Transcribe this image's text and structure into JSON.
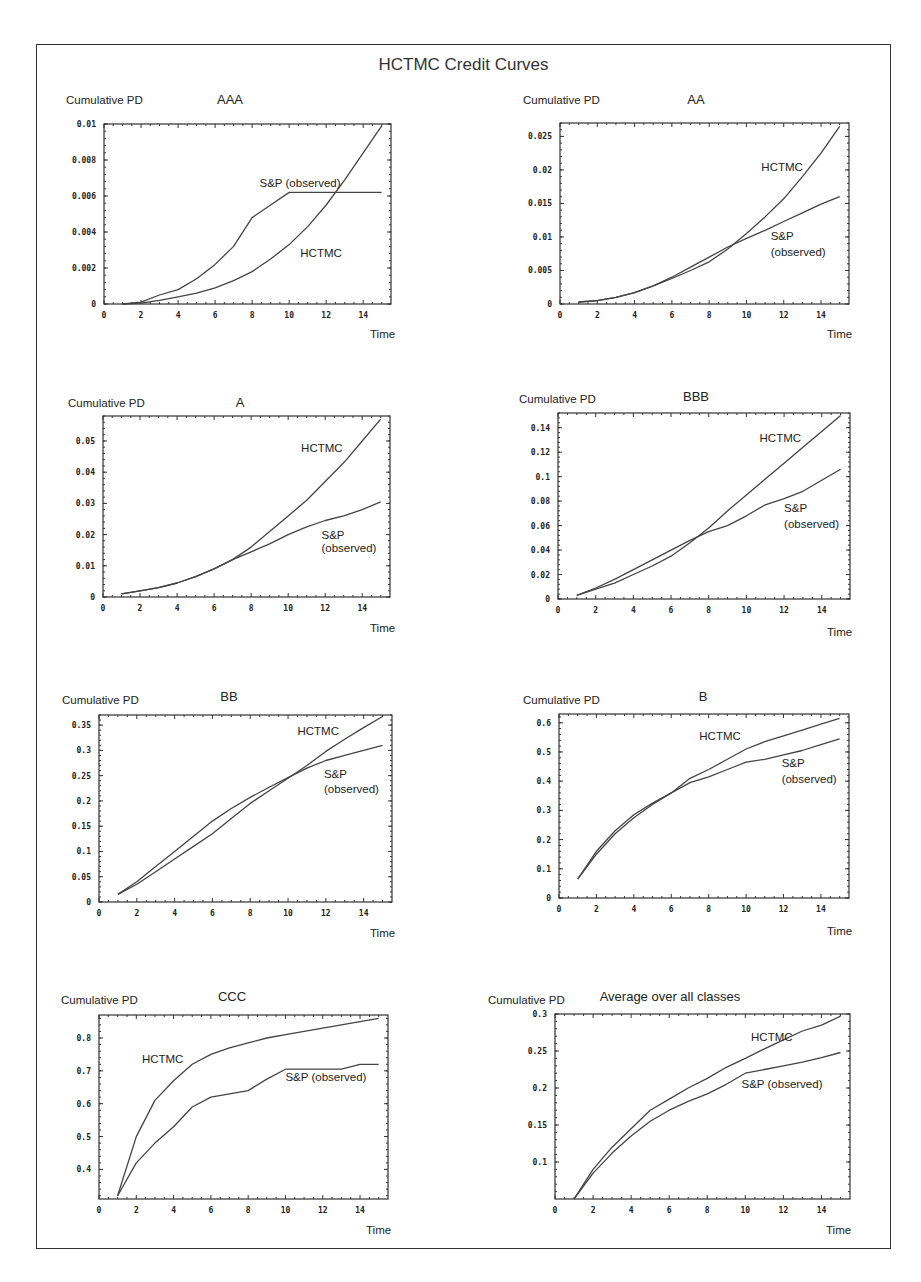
{
  "figure": {
    "title": "HCTMC Credit Curves"
  },
  "chart_data": [
    {
      "type": "line",
      "title": "AAA",
      "xlabel": "Time",
      "ylabel": "Cumulative PD",
      "xlim": [
        0,
        15.5
      ],
      "ylim": [
        0,
        0.01
      ],
      "xticks": [
        "0",
        "2",
        "4",
        "6",
        "8",
        "10",
        "12",
        "14"
      ],
      "yticks": [
        {
          "v": 0,
          "l": "0"
        },
        {
          "v": 0.002,
          "l": "0.002"
        },
        {
          "v": 0.004,
          "l": "0.004"
        },
        {
          "v": 0.006,
          "l": "0.006"
        },
        {
          "v": 0.008,
          "l": "0.008"
        },
        {
          "v": 0.01,
          "l": "0.01"
        }
      ],
      "grid": false,
      "x": [
        1,
        2,
        3,
        4,
        5,
        6,
        7,
        8,
        9,
        10,
        11,
        12,
        13,
        14,
        15
      ],
      "series": [
        {
          "name": "S&P (observed)",
          "values": [
            0,
            0.0001,
            0.0005,
            0.0008,
            0.0014,
            0.0022,
            0.0032,
            0.0048,
            0.0055,
            0.0062,
            0.0062,
            0.0062,
            0.0062,
            0.0062,
            0.0062
          ]
        },
        {
          "name": "HCTMC",
          "values": [
            0,
            5e-05,
            0.0002,
            0.0004,
            0.0006,
            0.0009,
            0.0013,
            0.0018,
            0.0025,
            0.0033,
            0.0043,
            0.0055,
            0.0069,
            0.0084,
            0.0099
          ]
        }
      ],
      "annotations": [
        {
          "text": "S&P (observed)",
          "x": 8.4,
          "y": 0.0065
        },
        {
          "text": "HCTMC",
          "x": 10.6,
          "y": 0.0026
        }
      ]
    },
    {
      "type": "line",
      "title": "AA",
      "xlabel": "Time",
      "ylabel": "Cumulative PD",
      "xlim": [
        0,
        15.5
      ],
      "ylim": [
        0,
        0.027
      ],
      "xticks": [
        "0",
        "2",
        "4",
        "6",
        "8",
        "10",
        "12",
        "14"
      ],
      "yticks": [
        {
          "v": 0,
          "l": "0"
        },
        {
          "v": 0.005,
          "l": "0.005"
        },
        {
          "v": 0.01,
          "l": "0.01"
        },
        {
          "v": 0.015,
          "l": "0.015"
        },
        {
          "v": 0.02,
          "l": "0.02"
        },
        {
          "v": 0.025,
          "l": "0.025"
        }
      ],
      "grid": false,
      "x": [
        1,
        2,
        3,
        4,
        5,
        6,
        7,
        8,
        9,
        10,
        11,
        12,
        13,
        14,
        15
      ],
      "series": [
        {
          "name": "HCTMC",
          "values": [
            0.0003,
            0.0005,
            0.001,
            0.0017,
            0.0027,
            0.0038,
            0.005,
            0.0063,
            0.0082,
            0.0105,
            0.013,
            0.0157,
            0.019,
            0.0225,
            0.0265
          ]
        },
        {
          "name": "S&P (observed)",
          "values": [
            0.0003,
            0.0005,
            0.001,
            0.0017,
            0.0027,
            0.004,
            0.0055,
            0.007,
            0.0085,
            0.0098,
            0.011,
            0.0123,
            0.0136,
            0.0149,
            0.016
          ]
        }
      ],
      "annotations": [
        {
          "text": "HCTMC",
          "x": 10.8,
          "y": 0.0198
        },
        {
          "text": "S&P",
          "x": 11.3,
          "y": 0.0096
        },
        {
          "text": "(observed)",
          "x": 11.3,
          "y": 0.0072
        }
      ]
    },
    {
      "type": "line",
      "title": "A",
      "xlabel": "Time",
      "ylabel": "Cumulative PD",
      "xlim": [
        0,
        15.5
      ],
      "ylim": [
        0,
        0.058
      ],
      "xticks": [
        "0",
        "2",
        "4",
        "6",
        "8",
        "10",
        "12",
        "14"
      ],
      "yticks": [
        {
          "v": 0,
          "l": "0"
        },
        {
          "v": 0.01,
          "l": "0.01"
        },
        {
          "v": 0.02,
          "l": "0.02"
        },
        {
          "v": 0.03,
          "l": "0.03"
        },
        {
          "v": 0.04,
          "l": "0.04"
        },
        {
          "v": 0.05,
          "l": "0.05"
        }
      ],
      "grid": false,
      "x": [
        1,
        2,
        3,
        4,
        5,
        6,
        7,
        8,
        9,
        10,
        11,
        12,
        13,
        14,
        15
      ],
      "series": [
        {
          "name": "HCTMC",
          "values": [
            0.001,
            0.002,
            0.003,
            0.0045,
            0.0065,
            0.009,
            0.012,
            0.016,
            0.021,
            0.026,
            0.031,
            0.037,
            0.043,
            0.05,
            0.057
          ]
        },
        {
          "name": "S&P (observed)",
          "values": [
            0.001,
            0.002,
            0.003,
            0.0045,
            0.0065,
            0.009,
            0.012,
            0.0145,
            0.017,
            0.02,
            0.0225,
            0.0245,
            0.026,
            0.028,
            0.0305
          ]
        }
      ],
      "annotations": [
        {
          "text": "HCTMC",
          "x": 10.7,
          "y": 0.0465
        },
        {
          "text": "S&P",
          "x": 11.8,
          "y": 0.0185
        },
        {
          "text": "(observed)",
          "x": 11.8,
          "y": 0.0145
        }
      ]
    },
    {
      "type": "line",
      "title": "BBB",
      "xlabel": "Time",
      "ylabel": "Cumulative PD",
      "xlim": [
        0,
        15.5
      ],
      "ylim": [
        0,
        0.152
      ],
      "xticks": [
        "0",
        "2",
        "4",
        "6",
        "8",
        "10",
        "12",
        "14"
      ],
      "yticks": [
        {
          "v": 0,
          "l": "0"
        },
        {
          "v": 0.02,
          "l": "0.02"
        },
        {
          "v": 0.04,
          "l": "0.04"
        },
        {
          "v": 0.06,
          "l": "0.06"
        },
        {
          "v": 0.08,
          "l": "0.08"
        },
        {
          "v": 0.1,
          "l": "0.1"
        },
        {
          "v": 0.12,
          "l": "0.12"
        },
        {
          "v": 0.14,
          "l": "0.14"
        }
      ],
      "grid": false,
      "x": [
        1,
        2,
        3,
        4,
        5,
        6,
        7,
        8,
        9,
        10,
        11,
        12,
        13,
        14,
        15
      ],
      "series": [
        {
          "name": "HCTMC",
          "values": [
            0.003,
            0.008,
            0.013,
            0.02,
            0.027,
            0.035,
            0.046,
            0.058,
            0.072,
            0.085,
            0.098,
            0.111,
            0.124,
            0.137,
            0.15
          ]
        },
        {
          "name": "S&P (observed)",
          "values": [
            0.003,
            0.009,
            0.016,
            0.024,
            0.032,
            0.04,
            0.048,
            0.055,
            0.06,
            0.068,
            0.077,
            0.082,
            0.088,
            0.097,
            0.106
          ]
        }
      ],
      "annotations": [
        {
          "text": "HCTMC",
          "x": 10.7,
          "y": 0.128
        },
        {
          "text": "S&P",
          "x": 12.0,
          "y": 0.071
        },
        {
          "text": "(observed)",
          "x": 12.0,
          "y": 0.058
        }
      ]
    },
    {
      "type": "line",
      "title": "BB",
      "xlabel": "Time",
      "ylabel": "Cumulative PD",
      "xlim": [
        0,
        15.5
      ],
      "ylim": [
        0,
        0.37
      ],
      "xticks": [
        "0",
        "2",
        "4",
        "6",
        "8",
        "10",
        "12",
        "14"
      ],
      "yticks": [
        {
          "v": 0,
          "l": "0"
        },
        {
          "v": 0.05,
          "l": "0.05"
        },
        {
          "v": 0.1,
          "l": "0.1"
        },
        {
          "v": 0.15,
          "l": "0.15"
        },
        {
          "v": 0.2,
          "l": "0.2"
        },
        {
          "v": 0.25,
          "l": "0.25"
        },
        {
          "v": 0.3,
          "l": "0.3"
        },
        {
          "v": 0.35,
          "l": "0.35"
        }
      ],
      "grid": false,
      "x": [
        1,
        2,
        3,
        4,
        5,
        6,
        7,
        8,
        9,
        10,
        11,
        12,
        13,
        14,
        15
      ],
      "series": [
        {
          "name": "HCTMC",
          "values": [
            0.015,
            0.035,
            0.06,
            0.085,
            0.11,
            0.135,
            0.165,
            0.195,
            0.22,
            0.245,
            0.27,
            0.298,
            0.322,
            0.345,
            0.367
          ]
        },
        {
          "name": "S&P (observed)",
          "values": [
            0.015,
            0.04,
            0.07,
            0.1,
            0.13,
            0.16,
            0.185,
            0.207,
            0.227,
            0.246,
            0.265,
            0.28,
            0.29,
            0.3,
            0.31
          ]
        }
      ],
      "annotations": [
        {
          "text": "HCTMC",
          "x": 10.5,
          "y": 0.33
        },
        {
          "text": "S&P",
          "x": 11.9,
          "y": 0.245
        },
        {
          "text": "(observed)",
          "x": 11.9,
          "y": 0.215
        }
      ]
    },
    {
      "type": "line",
      "title": "B",
      "xlabel": "Time",
      "ylabel": "Cumulative PD",
      "xlim": [
        0,
        15.5
      ],
      "ylim": [
        0,
        0.63
      ],
      "xticks": [
        "0",
        "2",
        "4",
        "6",
        "8",
        "10",
        "12",
        "14"
      ],
      "yticks": [
        {
          "v": 0,
          "l": "0"
        },
        {
          "v": 0.1,
          "l": "0.1"
        },
        {
          "v": 0.2,
          "l": "0.2"
        },
        {
          "v": 0.3,
          "l": "0.3"
        },
        {
          "v": 0.4,
          "l": "0.4"
        },
        {
          "v": 0.5,
          "l": "0.5"
        },
        {
          "v": 0.6,
          "l": "0.6"
        }
      ],
      "grid": false,
      "x": [
        1,
        2,
        3,
        4,
        5,
        6,
        7,
        8,
        9,
        10,
        11,
        12,
        13,
        14,
        15
      ],
      "series": [
        {
          "name": "HCTMC",
          "values": [
            0.065,
            0.15,
            0.22,
            0.275,
            0.32,
            0.36,
            0.41,
            0.44,
            0.475,
            0.51,
            0.535,
            0.555,
            0.575,
            0.595,
            0.615
          ]
        },
        {
          "name": "S&P (observed)",
          "values": [
            0.065,
            0.16,
            0.23,
            0.285,
            0.325,
            0.36,
            0.395,
            0.415,
            0.44,
            0.465,
            0.475,
            0.49,
            0.505,
            0.525,
            0.545
          ]
        }
      ],
      "annotations": [
        {
          "text": "HCTMC",
          "x": 7.5,
          "y": 0.54
        },
        {
          "text": "S&P",
          "x": 11.9,
          "y": 0.45
        },
        {
          "text": "(observed)",
          "x": 11.9,
          "y": 0.395
        }
      ]
    },
    {
      "type": "line",
      "title": "CCC",
      "xlabel": "Time",
      "ylabel": "Cumulative PD",
      "xlim": [
        0,
        15.5
      ],
      "ylim": [
        0.31,
        0.87
      ],
      "xticks": [
        "0",
        "2",
        "4",
        "6",
        "8",
        "10",
        "12",
        "14"
      ],
      "yticks": [
        {
          "v": 0.4,
          "l": "0.4"
        },
        {
          "v": 0.5,
          "l": "0.5"
        },
        {
          "v": 0.6,
          "l": "0.6"
        },
        {
          "v": 0.7,
          "l": "0.7"
        },
        {
          "v": 0.8,
          "l": "0.8"
        }
      ],
      "grid": false,
      "x": [
        1,
        2,
        3,
        4,
        5,
        6,
        7,
        8,
        9,
        10,
        11,
        12,
        13,
        14,
        15
      ],
      "series": [
        {
          "name": "HCTMC",
          "values": [
            0.32,
            0.5,
            0.61,
            0.67,
            0.72,
            0.75,
            0.77,
            0.785,
            0.8,
            0.81,
            0.82,
            0.83,
            0.84,
            0.85,
            0.86
          ]
        },
        {
          "name": "S&P (observed)",
          "values": [
            0.32,
            0.42,
            0.48,
            0.53,
            0.59,
            0.62,
            0.63,
            0.64,
            0.675,
            0.705,
            0.705,
            0.705,
            0.705,
            0.72,
            0.72
          ]
        }
      ],
      "annotations": [
        {
          "text": "HCTMC",
          "x": 2.3,
          "y": 0.723
        },
        {
          "text": "S&P (observed)",
          "x": 10.0,
          "y": 0.67
        }
      ]
    },
    {
      "type": "line",
      "title": "Average over all classes",
      "xlabel": "Time",
      "ylabel": "Cumulative PD",
      "xlim": [
        0,
        15.5
      ],
      "ylim": [
        0.05,
        0.3
      ],
      "xticks": [
        "0",
        "2",
        "4",
        "6",
        "8",
        "10",
        "12",
        "14"
      ],
      "yticks": [
        {
          "v": 0.1,
          "l": "0.1"
        },
        {
          "v": 0.15,
          "l": "0.15"
        },
        {
          "v": 0.2,
          "l": "0.2"
        },
        {
          "v": 0.25,
          "l": "0.25"
        },
        {
          "v": 0.3,
          "l": "0.3"
        }
      ],
      "grid": false,
      "x": [
        1,
        2,
        3,
        4,
        5,
        6,
        7,
        8,
        9,
        10,
        11,
        12,
        13,
        14,
        15
      ],
      "series": [
        {
          "name": "HCTMC",
          "values": [
            0.05,
            0.09,
            0.12,
            0.145,
            0.17,
            0.185,
            0.2,
            0.213,
            0.228,
            0.24,
            0.253,
            0.265,
            0.277,
            0.285,
            0.297
          ]
        },
        {
          "name": "S&P (observed)",
          "values": [
            0.05,
            0.085,
            0.112,
            0.135,
            0.155,
            0.17,
            0.182,
            0.192,
            0.205,
            0.22,
            0.225,
            0.23,
            0.235,
            0.241,
            0.248
          ]
        }
      ],
      "annotations": [
        {
          "text": "HCTMC",
          "x": 10.3,
          "y": 0.263
        },
        {
          "text": "S&P (observed)",
          "x": 9.8,
          "y": 0.2
        }
      ]
    }
  ],
  "layout": {
    "panels": [
      {
        "box": [
          104,
          124,
          391,
          304
        ],
        "ylabel_pos": [
          66,
          104
        ],
        "title_pos": [
          230,
          104
        ],
        "xlabel_pos": [
          370,
          338
        ]
      },
      {
        "box": [
          560,
          123,
          849,
          304
        ],
        "ylabel_pos": [
          523,
          104
        ],
        "title_pos": [
          696,
          104
        ],
        "xlabel_pos": [
          827,
          338
        ]
      },
      {
        "box": [
          103,
          416,
          390,
          597
        ],
        "ylabel_pos": [
          68,
          407
        ],
        "title_pos": [
          240,
          407
        ],
        "xlabel_pos": [
          370,
          632
        ]
      },
      {
        "box": [
          558,
          413,
          850,
          599
        ],
        "ylabel_pos": [
          519,
          403
        ],
        "title_pos": [
          696,
          401
        ],
        "xlabel_pos": [
          827,
          636
        ]
      },
      {
        "box": [
          99,
          715,
          392,
          902
        ],
        "ylabel_pos": [
          62,
          704
        ],
        "title_pos": [
          229,
          701
        ],
        "xlabel_pos": [
          370,
          937
        ]
      },
      {
        "box": [
          559,
          714,
          849,
          898
        ],
        "ylabel_pos": [
          523,
          704
        ],
        "title_pos": [
          703,
          701
        ],
        "xlabel_pos": [
          827,
          935
        ]
      },
      {
        "box": [
          99,
          1015,
          388,
          1199
        ],
        "ylabel_pos": [
          61,
          1004
        ],
        "title_pos": [
          232,
          1001
        ],
        "xlabel_pos": [
          366,
          1234
        ]
      },
      {
        "box": [
          555,
          1014,
          850,
          1199
        ],
        "ylabel_pos": [
          488,
          1004
        ],
        "title_pos": [
          670,
          1001
        ],
        "xlabel_pos": [
          826,
          1234
        ]
      }
    ]
  }
}
